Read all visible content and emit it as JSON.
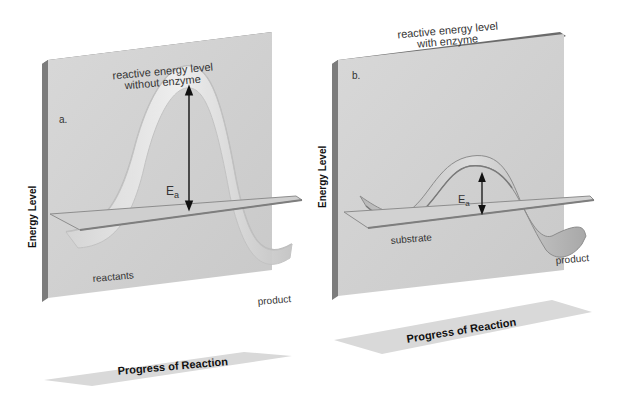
{
  "panels": [
    {
      "id": "a",
      "letter": "a.",
      "title_line1": "reactive energy level",
      "title_line2": "without enzyme",
      "y_axis_label": "Energy Level",
      "x_axis_label": "Progress of Reaction",
      "curve_start_label": "reactants",
      "curve_end_label": "product",
      "activation_energy_label": "E",
      "activation_energy_subscript": "a",
      "barrier": "high"
    },
    {
      "id": "b",
      "letter": "b.",
      "title_line1": "reactive energy level",
      "title_line2": "with enzyme",
      "y_axis_label": "Energy Level",
      "x_axis_label": "Progress of Reaction",
      "curve_start_label": "substrate",
      "curve_end_label": "product",
      "activation_energy_label": "E",
      "activation_energy_subscript": "a",
      "barrier": "low"
    }
  ],
  "colors": {
    "panel_face": "#d4d4d4",
    "panel_edge": "#7a7a7a",
    "panel_top": "#6a6a6a",
    "baseline_plane": "#c8c8c8",
    "ribbon_light": "#e6e6e6",
    "ribbon_shadow": "#a8a8a8",
    "axis_plane": "#d9d9d9"
  }
}
